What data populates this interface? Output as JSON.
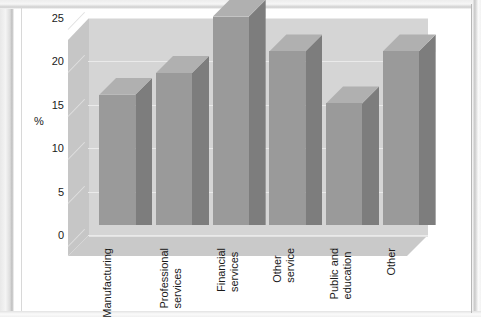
{
  "chart_data": {
    "type": "bar",
    "title": "",
    "subtitle": "",
    "xlabel": "",
    "ylabel": "%",
    "categories": [
      "Manufacturing",
      "Professional\nservices",
      "Financial\nservices",
      "Other\nservice",
      "Public and\neducation",
      "Other"
    ],
    "values": [
      15,
      17.5,
      24,
      20,
      14,
      20
    ],
    "ylim": [
      0,
      25
    ],
    "yticks": [
      25,
      20,
      15,
      10,
      5,
      0
    ],
    "ytick_labels": [
      "25",
      "20",
      "15",
      "10",
      "5",
      "0"
    ],
    "grid": true,
    "legend": false,
    "style": "3d-column",
    "colors": {
      "bar_front": "#9a9a9a",
      "bar_side": "#7d7d7d",
      "bar_top": "#b0b0b0",
      "back_wall": "#d5d5d5",
      "left_wall": "#c6c6c6",
      "floor": "#c9c9c9",
      "gridline": "#eaeaea",
      "text": "#1a1a1a",
      "page_background": "#ffffff"
    }
  }
}
